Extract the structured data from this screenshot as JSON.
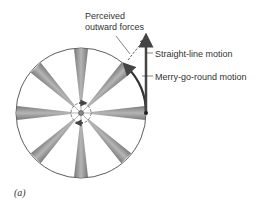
{
  "figure": {
    "caption": "(a)",
    "labels": {
      "perceived_line1": "Perceived",
      "perceived_line2": "outward forces",
      "straight": "Straight-line motion",
      "merry": "Merry-go-round motion"
    },
    "colors": {
      "outline": "#333333",
      "spoke": "#8a8a8a",
      "arrow": "#444444",
      "text": "#333333"
    },
    "wheel": {
      "cx": 81,
      "cy": 113,
      "r": 65,
      "spokes": 8
    }
  }
}
